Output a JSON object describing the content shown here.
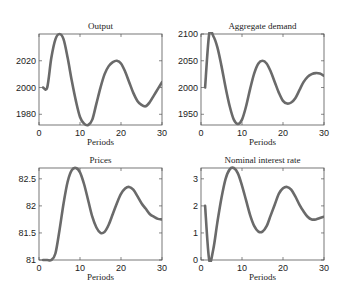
{
  "chart_data": [
    {
      "type": "line",
      "title": "Output",
      "xlabel": "Periods",
      "ylabel": "",
      "xlim": [
        0,
        30
      ],
      "ylim": [
        1972,
        2040
      ],
      "xticks": [
        0,
        10,
        20,
        30
      ],
      "yticks": [
        1980,
        2000,
        2020
      ],
      "grid": false,
      "x": [
        1,
        2,
        3,
        4,
        5,
        6,
        7,
        8,
        9,
        10,
        11,
        12,
        13,
        14,
        15,
        16,
        17,
        18,
        19,
        20,
        21,
        22,
        23,
        24,
        25,
        26,
        27,
        28,
        29,
        30
      ],
      "values": [
        2000,
        2000,
        2022,
        2036,
        2040,
        2036,
        2022,
        2005,
        1990,
        1978,
        1973,
        1972,
        1976,
        1988,
        2000,
        2010,
        2016,
        2019,
        2020,
        2018,
        2012,
        2004,
        1996,
        1990,
        1987,
        1986,
        1989,
        1994,
        1999,
        2004
      ]
    },
    {
      "type": "line",
      "title": "Aggregate demand",
      "xlabel": "Periods",
      "ylabel": "",
      "xlim": [
        0,
        30
      ],
      "ylim": [
        1930,
        2100
      ],
      "xticks": [
        0,
        10,
        20,
        30
      ],
      "yticks": [
        1950,
        2000,
        2050,
        2100
      ],
      "grid": false,
      "x": [
        1,
        2,
        3,
        4,
        5,
        6,
        7,
        8,
        9,
        10,
        11,
        12,
        13,
        14,
        15,
        16,
        17,
        18,
        19,
        20,
        21,
        22,
        23,
        24,
        25,
        26,
        27,
        28,
        29,
        30
      ],
      "values": [
        2000,
        2100,
        2096,
        2075,
        2040,
        2000,
        1965,
        1940,
        1932,
        1940,
        1965,
        1998,
        2027,
        2045,
        2050,
        2045,
        2030,
        2010,
        1990,
        1975,
        1970,
        1972,
        1980,
        1995,
        2010,
        2020,
        2025,
        2027,
        2026,
        2022
      ]
    },
    {
      "type": "line",
      "title": "Prices",
      "xlabel": "Periods",
      "ylabel": "",
      "xlim": [
        0,
        30
      ],
      "ylim": [
        81,
        82.7
      ],
      "xticks": [
        0,
        10,
        20,
        30
      ],
      "yticks": [
        81,
        81.5,
        82,
        82.5
      ],
      "grid": false,
      "x": [
        1,
        2,
        3,
        4,
        5,
        6,
        7,
        8,
        9,
        10,
        11,
        12,
        13,
        14,
        15,
        16,
        17,
        18,
        19,
        20,
        21,
        22,
        23,
        24,
        25,
        26,
        27,
        28,
        29,
        30
      ],
      "values": [
        81.0,
        81.0,
        81.0,
        81.12,
        81.55,
        82.05,
        82.45,
        82.66,
        82.7,
        82.62,
        82.4,
        82.1,
        81.8,
        81.6,
        81.5,
        81.52,
        81.65,
        81.85,
        82.05,
        82.22,
        82.32,
        82.35,
        82.3,
        82.18,
        82.05,
        81.95,
        81.85,
        81.8,
        81.76,
        81.75
      ]
    },
    {
      "type": "line",
      "title": "Nominal interest rate",
      "xlabel": "Periods",
      "ylabel": "",
      "xlim": [
        0,
        30
      ],
      "ylim": [
        0,
        3.4
      ],
      "xticks": [
        0,
        10,
        20,
        30
      ],
      "yticks": [
        0,
        1,
        2,
        3
      ],
      "grid": false,
      "x": [
        1,
        2,
        3,
        4,
        5,
        6,
        7,
        8,
        9,
        10,
        11,
        12,
        13,
        14,
        15,
        16,
        17,
        18,
        19,
        20,
        21,
        22,
        23,
        24,
        25,
        26,
        27,
        28,
        29,
        30
      ],
      "values": [
        2.0,
        0.0,
        0.4,
        1.4,
        2.3,
        3.0,
        3.35,
        3.4,
        3.2,
        2.75,
        2.2,
        1.65,
        1.25,
        1.05,
        1.05,
        1.25,
        1.65,
        2.05,
        2.45,
        2.65,
        2.7,
        2.6,
        2.35,
        2.05,
        1.8,
        1.6,
        1.5,
        1.5,
        1.55,
        1.6
      ]
    }
  ]
}
